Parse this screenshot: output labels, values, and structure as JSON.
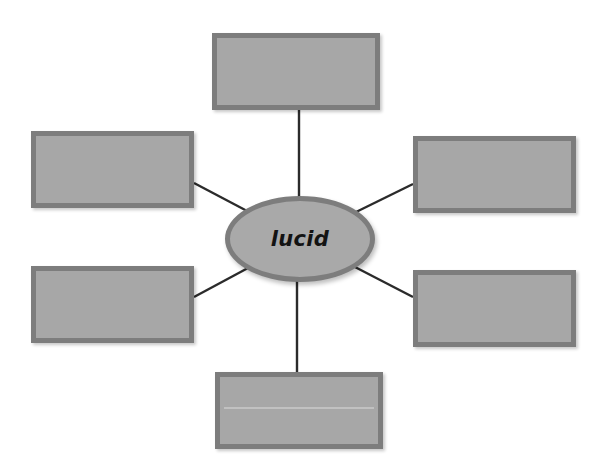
{
  "diagram": {
    "type": "word-web-graphic-organizer",
    "title": "",
    "background_color": "#ffffff",
    "node_fill_color": "#a7a7a7",
    "node_border_color": "#7d7d7d",
    "connector_color": "#2b2b2b",
    "text_color": "#131313",
    "center": {
      "label": "lucid",
      "shape": "ellipse",
      "x": 225,
      "y": 196,
      "width": 150,
      "height": 86
    },
    "boxes": [
      {
        "id": "top",
        "label": "",
        "x": 212,
        "y": 33,
        "width": 168,
        "height": 77
      },
      {
        "id": "upper-left",
        "label": "",
        "x": 31,
        "y": 131,
        "width": 163,
        "height": 77
      },
      {
        "id": "upper-right",
        "label": "",
        "x": 413,
        "y": 136,
        "width": 163,
        "height": 77
      },
      {
        "id": "lower-left",
        "label": "",
        "x": 31,
        "y": 266,
        "width": 163,
        "height": 77
      },
      {
        "id": "lower-right",
        "label": "",
        "x": 413,
        "y": 270,
        "width": 163,
        "height": 77
      },
      {
        "id": "bottom",
        "label": "",
        "x": 215,
        "y": 372,
        "width": 168,
        "height": 77
      }
    ],
    "connectors": [
      {
        "id": "center-to-top",
        "from": "center",
        "to": "top",
        "x1": 299,
        "y1": 197,
        "x2": 299,
        "y2": 110
      },
      {
        "id": "center-to-upper-left",
        "from": "center",
        "to": "upper-left",
        "x1": 249,
        "y1": 212,
        "x2": 194,
        "y2": 183
      },
      {
        "id": "center-to-upper-right",
        "from": "center",
        "to": "upper-right",
        "x1": 354,
        "y1": 213,
        "x2": 413,
        "y2": 184
      },
      {
        "id": "center-to-lower-left",
        "from": "center",
        "to": "lower-left",
        "x1": 248,
        "y1": 268,
        "x2": 194,
        "y2": 297
      },
      {
        "id": "center-to-lower-right",
        "from": "center",
        "to": "lower-right",
        "x1": 353,
        "y1": 266,
        "x2": 413,
        "y2": 297
      },
      {
        "id": "center-to-bottom",
        "from": "center",
        "to": "bottom",
        "x1": 297,
        "y1": 281,
        "x2": 297,
        "y2": 372
      }
    ]
  }
}
